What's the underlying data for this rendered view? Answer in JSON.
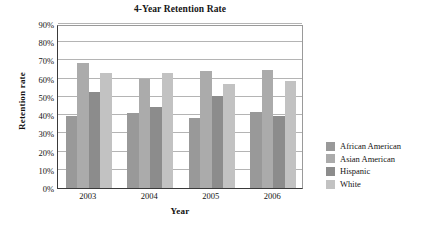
{
  "chart_data": {
    "type": "bar",
    "title": "4-Year Retention Rate",
    "xlabel": "Year",
    "ylabel": "Retention rate",
    "categories": [
      "2003",
      "2004",
      "2005",
      "2006"
    ],
    "ylim": [
      0,
      90
    ],
    "ytick_labels": [
      "0%",
      "10%",
      "20%",
      "30%",
      "40%",
      "50%",
      "60%",
      "70%",
      "80%",
      "90%"
    ],
    "ytick_values": [
      0,
      10,
      20,
      30,
      40,
      50,
      60,
      70,
      80,
      90
    ],
    "grid": true,
    "legend_position": "right",
    "series": [
      {
        "name": "African American",
        "color": "#999999",
        "values": [
          39.5,
          41.0,
          38.5,
          41.5
        ]
      },
      {
        "name": "Asian American",
        "color": "#ababab",
        "values": [
          68.5,
          60.0,
          64.0,
          64.5
        ]
      },
      {
        "name": "Hispanic",
        "color": "#8c8c8c",
        "values": [
          52.5,
          44.5,
          50.5,
          39.5
        ]
      },
      {
        "name": "White",
        "color": "#c2c2c2",
        "values": [
          63.0,
          63.0,
          57.0,
          58.5
        ]
      }
    ]
  }
}
